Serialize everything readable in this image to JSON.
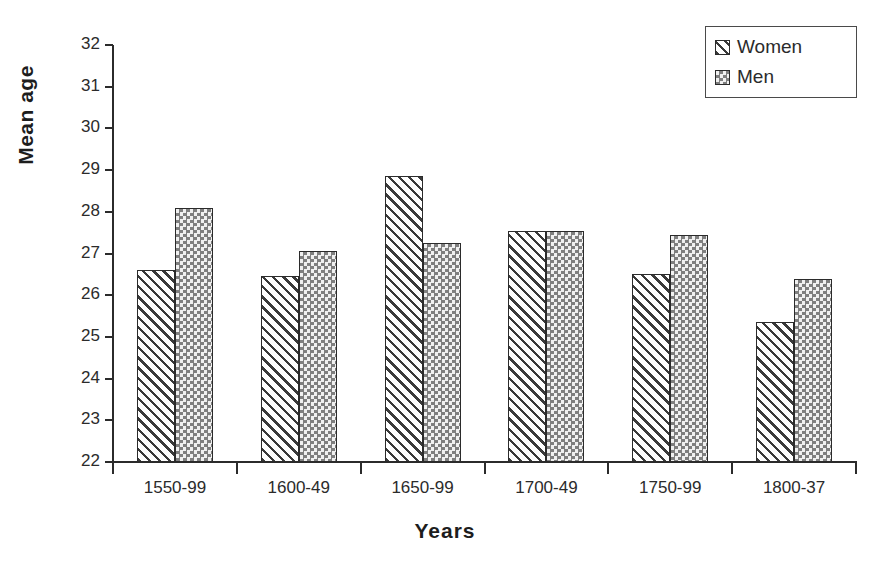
{
  "chart_data": {
    "type": "bar",
    "title": "",
    "xlabel": "Years",
    "ylabel": "Mean age",
    "categories": [
      "1550-99",
      "1600-49",
      "1650-99",
      "1700-49",
      "1750-99",
      "1800-37"
    ],
    "series": [
      {
        "name": "Women",
        "values": [
          26.6,
          26.45,
          28.85,
          27.55,
          26.5,
          25.35
        ]
      },
      {
        "name": "Men",
        "values": [
          28.1,
          27.05,
          27.25,
          27.55,
          27.45,
          26.4
        ]
      }
    ],
    "ylim": [
      22,
      32
    ],
    "yticks": [
      22,
      23,
      24,
      25,
      26,
      27,
      28,
      29,
      30,
      31,
      32
    ],
    "ytick_labels": [
      "22",
      "23",
      "24",
      "25",
      "26",
      "27",
      "28",
      "29",
      "30",
      "31",
      "32"
    ],
    "grid": false,
    "legend_position": "top-right",
    "legend_entries": [
      "Women",
      "Men"
    ],
    "colors": {
      "women_pattern": "#3a3a3a",
      "men_pattern": "#7f7f7f",
      "axis": "#2b2b2b",
      "background": "#ffffff"
    }
  }
}
